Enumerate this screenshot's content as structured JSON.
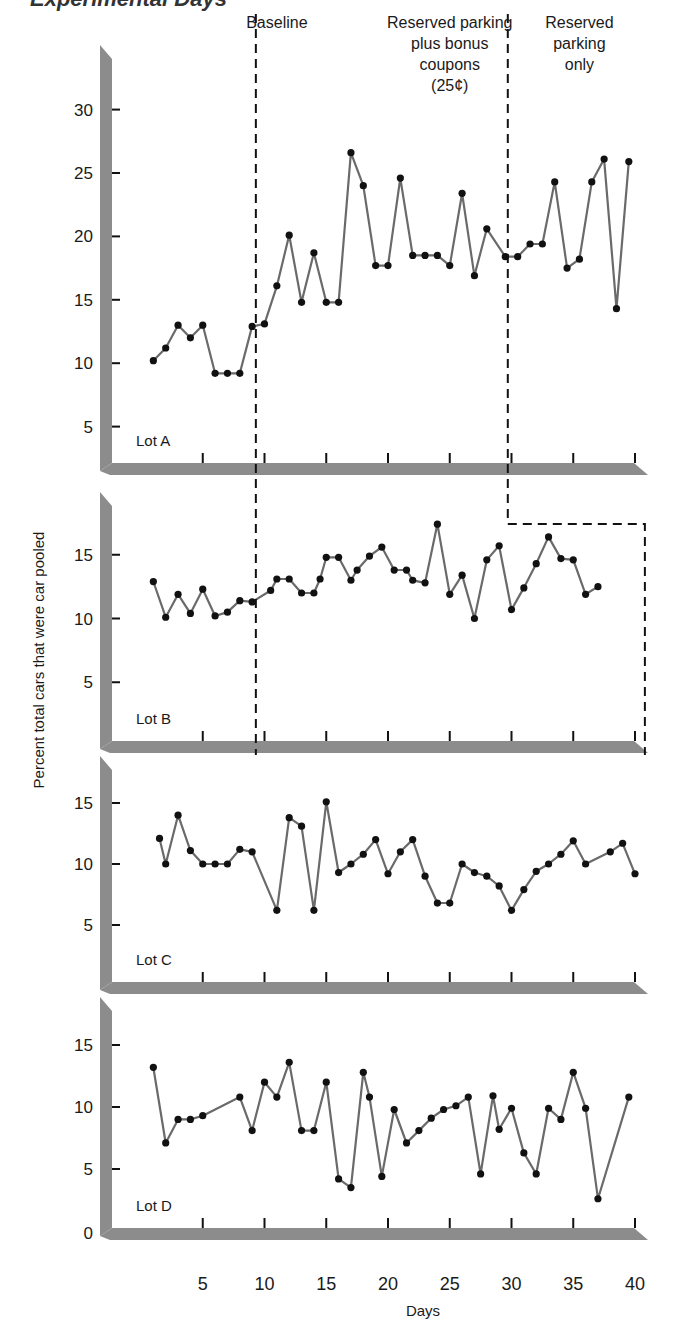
{
  "title_fragment": "Experimental Days",
  "chart_data": {
    "type": "line",
    "title": "",
    "xlabel": "Days",
    "ylabel": "Percent total cars that were car pooled",
    "x_ticks": [
      5,
      10,
      15,
      20,
      25,
      30,
      35,
      40
    ],
    "xlim": [
      0,
      41
    ],
    "phases": [
      {
        "label": [
          "Baseline"
        ],
        "x_center": 11.0
      },
      {
        "label": [
          "Reserved parking",
          "plus bonus",
          "coupons",
          "(25¢)"
        ],
        "x_center": 25.0
      },
      {
        "label": [
          "Reserved",
          "parking",
          "only"
        ],
        "x_center": 35.5
      }
    ],
    "phase_lines": {
      "baseline_end": 9.3,
      "coupons_end_lotA": 29.7,
      "only_end_lotB": 40.8
    },
    "colors": {
      "axis_bar": "#8c8c8c",
      "line": "#6a6a6a",
      "marker": "#111111",
      "dash": "#111111"
    },
    "panels": [
      {
        "name": "Lot A",
        "yticks": [
          5,
          10,
          15,
          20,
          25,
          30
        ],
        "ylim": [
          0,
          33
        ],
        "series": [
          [
            1,
            10.2
          ],
          [
            2,
            11.2
          ],
          [
            3,
            13.0
          ],
          [
            4,
            12.0
          ],
          [
            5,
            13.0
          ],
          [
            6,
            9.2
          ],
          [
            7,
            9.2
          ],
          [
            8,
            9.2
          ],
          [
            9,
            12.9
          ],
          [
            10,
            13.1
          ],
          [
            11,
            16.1
          ],
          [
            12,
            20.1
          ],
          [
            13,
            14.8
          ],
          [
            14,
            18.7
          ],
          [
            15,
            14.8
          ],
          [
            16,
            14.8
          ],
          [
            17,
            26.6
          ],
          [
            18,
            24.0
          ],
          [
            19,
            17.7
          ],
          [
            20,
            17.7
          ],
          [
            21,
            24.6
          ],
          [
            22,
            18.5
          ],
          [
            23,
            18.5
          ],
          [
            24,
            18.5
          ],
          [
            25,
            17.7
          ],
          [
            26,
            23.4
          ],
          [
            27,
            16.9
          ],
          [
            28,
            20.6
          ],
          [
            29.5,
            18.4
          ],
          [
            30.5,
            18.4
          ],
          [
            31.5,
            19.4
          ],
          [
            32.5,
            19.4
          ],
          [
            33.5,
            24.3
          ],
          [
            34.5,
            17.5
          ],
          [
            35.5,
            18.2
          ],
          [
            36.5,
            24.3
          ],
          [
            37.5,
            26.1
          ],
          [
            38.5,
            14.3
          ],
          [
            39.5,
            25.9
          ]
        ]
      },
      {
        "name": "Lot B",
        "yticks": [
          5,
          10,
          15
        ],
        "ylim": [
          0,
          18.5
        ],
        "series": [
          [
            1,
            12.9
          ],
          [
            2,
            10.1
          ],
          [
            3,
            11.9
          ],
          [
            4,
            10.4
          ],
          [
            5,
            12.3
          ],
          [
            6,
            10.2
          ],
          [
            7,
            10.5
          ],
          [
            8,
            11.4
          ],
          [
            9,
            11.3
          ],
          [
            10.5,
            12.2
          ],
          [
            11,
            13.1
          ],
          [
            12,
            13.1
          ],
          [
            13,
            12.0
          ],
          [
            14,
            12.0
          ],
          [
            14.5,
            13.1
          ],
          [
            15,
            14.8
          ],
          [
            16,
            14.8
          ],
          [
            17,
            13.0
          ],
          [
            17.5,
            13.8
          ],
          [
            18.5,
            14.9
          ],
          [
            19.5,
            15.6
          ],
          [
            20.5,
            13.8
          ],
          [
            21.5,
            13.8
          ],
          [
            22,
            13.0
          ],
          [
            23,
            12.8
          ],
          [
            24,
            17.4
          ],
          [
            25,
            11.9
          ],
          [
            26,
            13.4
          ],
          [
            27,
            10.0
          ],
          [
            28,
            14.6
          ],
          [
            29,
            15.7
          ],
          [
            30,
            10.7
          ],
          [
            31,
            12.4
          ],
          [
            32,
            14.3
          ],
          [
            33,
            16.4
          ],
          [
            34,
            14.7
          ],
          [
            35,
            14.6
          ],
          [
            36,
            11.9
          ],
          [
            37,
            12.5
          ]
        ]
      },
      {
        "name": "Lot C",
        "yticks": [
          5,
          10,
          15
        ],
        "ylim": [
          0,
          18.5
        ],
        "series": [
          [
            1.5,
            12.1
          ],
          [
            2,
            10.0
          ],
          [
            3,
            14.0
          ],
          [
            4,
            11.1
          ],
          [
            5,
            10.0
          ],
          [
            6,
            10.0
          ],
          [
            7,
            10.0
          ],
          [
            8,
            11.2
          ],
          [
            9,
            11.0
          ],
          [
            11,
            6.2
          ],
          [
            12,
            13.8
          ],
          [
            13,
            13.1
          ],
          [
            14,
            6.2
          ],
          [
            15,
            15.1
          ],
          [
            16,
            9.3
          ],
          [
            17,
            10.0
          ],
          [
            18,
            10.8
          ],
          [
            19,
            12.0
          ],
          [
            20,
            9.2
          ],
          [
            21,
            11.0
          ],
          [
            22,
            12.0
          ],
          [
            23,
            9.0
          ],
          [
            24,
            6.8
          ],
          [
            25,
            6.8
          ],
          [
            26,
            10.0
          ],
          [
            27,
            9.3
          ],
          [
            28,
            9.0
          ],
          [
            29,
            8.2
          ],
          [
            30,
            6.2
          ],
          [
            31,
            7.9
          ],
          [
            32,
            9.4
          ],
          [
            33,
            10.0
          ],
          [
            34,
            10.8
          ],
          [
            35,
            11.9
          ],
          [
            36,
            10.0
          ],
          [
            38,
            11.0
          ],
          [
            39,
            11.7
          ],
          [
            40,
            9.2
          ]
        ]
      },
      {
        "name": "Lot D",
        "yticks": [
          0,
          5,
          10,
          15
        ],
        "ylim": [
          0,
          18.5
        ],
        "series": [
          [
            1,
            13.2
          ],
          [
            2,
            7.1
          ],
          [
            3,
            9.0
          ],
          [
            4,
            9.0
          ],
          [
            5,
            9.3
          ],
          [
            8,
            10.8
          ],
          [
            9,
            8.1
          ],
          [
            10,
            12.0
          ],
          [
            11,
            10.8
          ],
          [
            12,
            13.6
          ],
          [
            13,
            8.1
          ],
          [
            14,
            8.1
          ],
          [
            15,
            12.0
          ],
          [
            16,
            4.2
          ],
          [
            17,
            3.5
          ],
          [
            18,
            12.8
          ],
          [
            18.5,
            10.8
          ],
          [
            19.5,
            4.4
          ],
          [
            20.5,
            9.8
          ],
          [
            21.5,
            7.1
          ],
          [
            22.5,
            8.1
          ],
          [
            23.5,
            9.1
          ],
          [
            24.5,
            9.8
          ],
          [
            25.5,
            10.1
          ],
          [
            26.5,
            10.8
          ],
          [
            27.5,
            4.6
          ],
          [
            28.5,
            10.9
          ],
          [
            29,
            8.2
          ],
          [
            30,
            9.9
          ],
          [
            31,
            6.3
          ],
          [
            32,
            4.6
          ],
          [
            33,
            9.9
          ],
          [
            34,
            9.0
          ],
          [
            35,
            12.8
          ],
          [
            36,
            9.9
          ],
          [
            37,
            2.6
          ],
          [
            39.5,
            10.8
          ]
        ]
      }
    ]
  }
}
